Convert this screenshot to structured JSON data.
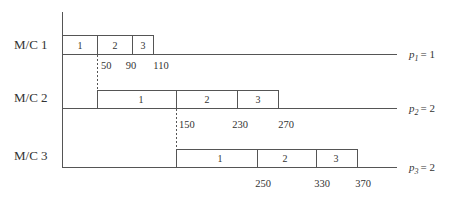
{
  "machines": [
    {
      "label": "M/C 1",
      "p_label": "p",
      "p_sub": "1",
      "p_value": "= 1",
      "jobs": [
        "1",
        "2",
        "3"
      ],
      "times": [
        "50",
        "90",
        "110"
      ]
    },
    {
      "label": "M/C 2",
      "p_label": "p",
      "p_sub": "2",
      "p_value": "= 2",
      "jobs": [
        "1",
        "2",
        "3"
      ],
      "times": [
        "150",
        "230",
        "270"
      ]
    },
    {
      "label": "M/C 3",
      "p_label": "p",
      "p_sub": "3",
      "p_value": "= 2",
      "jobs": [
        "1",
        "2",
        "3"
      ],
      "times": [
        "250",
        "330",
        "370"
      ]
    }
  ]
}
